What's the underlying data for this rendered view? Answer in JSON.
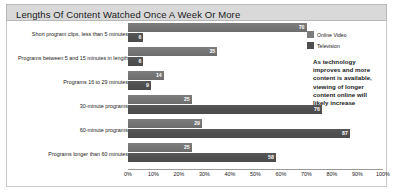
{
  "header": {
    "title": "Lengths Of Content Watched Once A Week Or More"
  },
  "legend": {
    "items": [
      {
        "label": "Online Video",
        "color": "#7d7d7d",
        "icon": "legend-swatch-icon"
      },
      {
        "label": "Television",
        "color": "#4f4f4f",
        "icon": "legend-swatch-icon"
      }
    ]
  },
  "annotation": {
    "text": "As technology improves and more content is available, viewing of longer content online will likely increase"
  },
  "axis": {
    "ticks": [
      "0%",
      "10%",
      "20%",
      "30%",
      "40%",
      "50%",
      "60%",
      "70%",
      "80%",
      "90%",
      "100%"
    ]
  },
  "chart_data": {
    "type": "bar",
    "orientation": "horizontal",
    "title": "Lengths Of Content Watched Once A Week Or More",
    "xlabel": "",
    "ylabel": "",
    "xlim": [
      0,
      100
    ],
    "grid": false,
    "legend_position": "right",
    "categories": [
      "Short program clips, less than 5 minutes",
      "Programs between 5 and 15 minutes in length",
      "Programs 16 to 29 minutes",
      "30-minute programs",
      "60-minute programs",
      "Programs longer than 60 minutes"
    ],
    "series": [
      {
        "name": "Online Video",
        "color": "#7d7d7d",
        "values": [
          70,
          35,
          14,
          25,
          29,
          25
        ]
      },
      {
        "name": "Television",
        "color": "#4f4f4f",
        "values": [
          6,
          6,
          9,
          76,
          87,
          58
        ]
      }
    ],
    "tick_labels": [
      "0%",
      "10%",
      "20%",
      "30%",
      "40%",
      "50%",
      "60%",
      "70%",
      "80%",
      "90%",
      "100%"
    ]
  }
}
